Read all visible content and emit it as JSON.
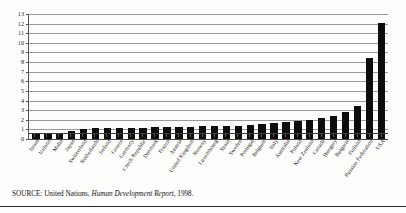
{
  "source_note": {
    "label": "SOURCE: United Nations,",
    "title": "Human Development Report",
    "year": ", 1998."
  },
  "chart_data": {
    "type": "bar",
    "title": "",
    "xlabel": "",
    "ylabel": "",
    "ylim": [
      0,
      13
    ],
    "grid": true,
    "legend": "none",
    "bar_color": "#0d0d0d",
    "yticks": [
      13,
      12,
      11,
      10,
      9,
      8,
      7,
      6,
      5,
      4,
      3,
      2,
      1,
      0
    ],
    "ytick_labels": [
      "13",
      "12",
      "11",
      "10",
      "9",
      "8",
      "7",
      "6",
      "5",
      "4",
      "3",
      "2",
      "1",
      "0"
    ],
    "categories": [
      "Israel",
      "Iceland",
      "Malta",
      "Japan",
      "Switzerland",
      "Netherlands",
      "Ireland",
      "Greece",
      "Germany",
      "Czech Republic",
      "Denmark",
      "France",
      "Austria",
      "United Kingdom",
      "Norway",
      "Luxembourg",
      "Spain",
      "Sweden",
      "Portugal",
      "Belgium",
      "Italy",
      "Australia",
      "Poland",
      "New Zealand",
      "Canada",
      "Hungary",
      "Bulgaria",
      "Finland",
      "Russian Federation",
      "USA"
    ],
    "values": [
      0.5,
      0.5,
      0.5,
      0.8,
      1.0,
      1.1,
      1.1,
      1.1,
      1.1,
      1.1,
      1.2,
      1.2,
      1.2,
      1.3,
      1.4,
      1.4,
      1.4,
      1.4,
      1.5,
      1.6,
      1.7,
      1.8,
      1.9,
      2.0,
      2.2,
      2.4,
      2.8,
      3.4,
      8.4,
      12.1
    ]
  }
}
